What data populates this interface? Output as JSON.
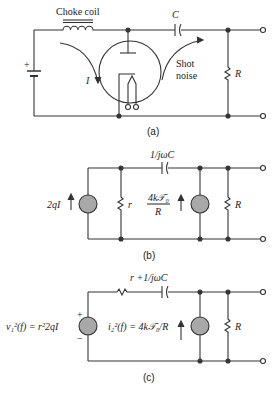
{
  "figure_a": {
    "label": "(a)",
    "choke_label": "Choke coil",
    "capacitor_label": "C",
    "current_label": "I",
    "shot_label_1": "Shot",
    "shot_label_2": "noise",
    "resistor_label": "R",
    "battery_plus": "+"
  },
  "figure_b": {
    "label": "(b)",
    "capacitor_label": "1/jωC",
    "source_left_label": "2qI",
    "small_r_label": "r",
    "noise_num": "4k𝒯₀",
    "noise_den": "R",
    "resistor_label": "R"
  },
  "figure_c": {
    "label": "(c)",
    "series_label": "r +1/jωC",
    "voltage_label": "v₁²(f) = r²2qI",
    "current_label": "i₂²(f) = 4k𝒯₀/R",
    "plus": "+",
    "minus": "−",
    "resistor_label": "R"
  },
  "colors": {
    "line": "#333333",
    "source_fill": "#a8a8a8"
  }
}
